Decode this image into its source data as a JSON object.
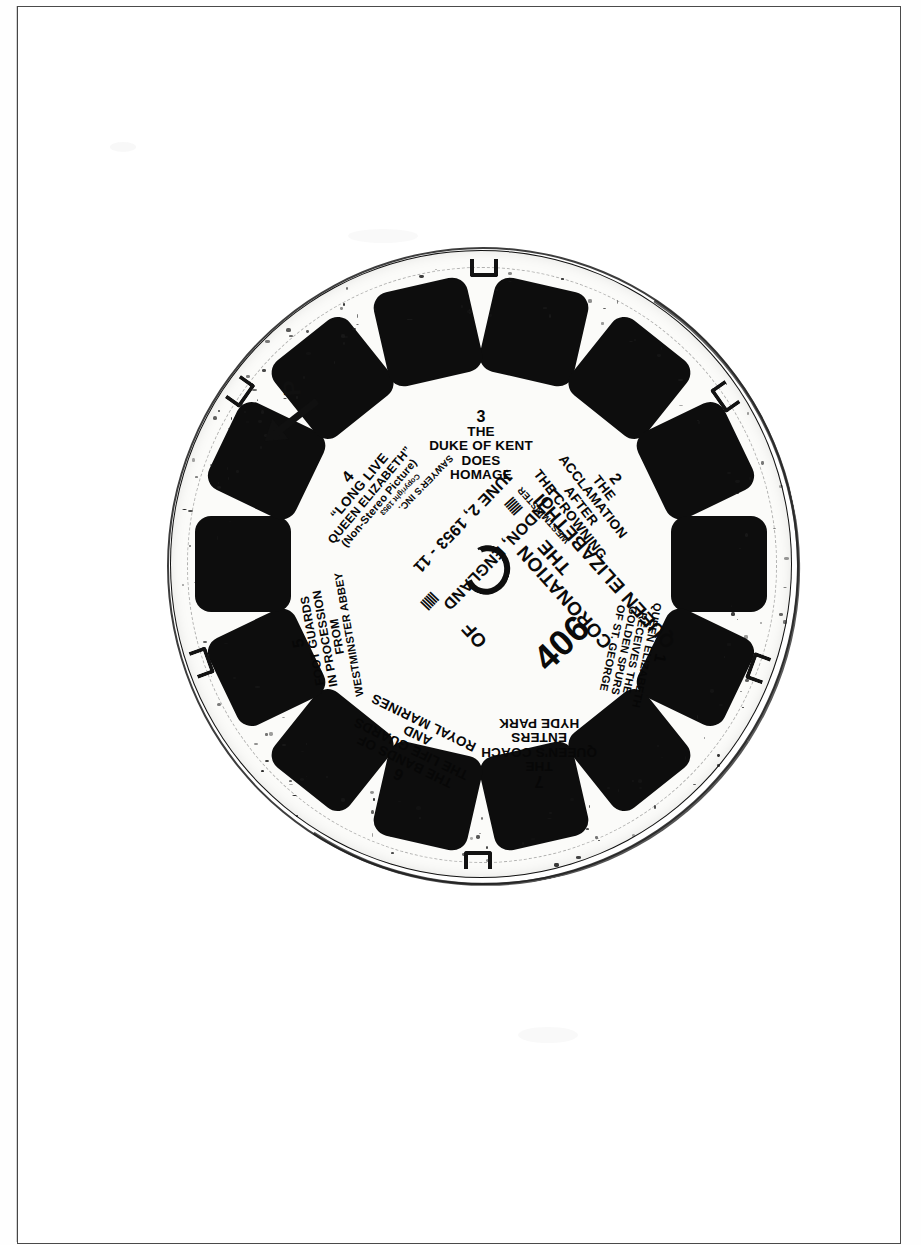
{
  "document": {
    "type": "scanned-photograph",
    "subject": "View-Master reel packet photograph"
  },
  "reel": {
    "catalog_number": "406",
    "title_line_1": "THE",
    "title_line_2": "CORONATION",
    "title_line_3": "OF",
    "title_line_4": "QUEEN ELIZABETH II",
    "title_full": "THE CORONATION OF QUEEN ELIZABETH II",
    "location": "LONDON, ENGLAND",
    "date": "JUNE 2, 1953 - 11",
    "maker": "SAWYER'S INC.",
    "copyright": "Copyright 1953",
    "secondary_mark": "WESTMINSTER",
    "frame_count": 14,
    "direction_letter": "P",
    "colors": {
      "disc": "#fbfbf9",
      "frame": "#0d0d0d",
      "ink": "#090909",
      "border": "#4a4a4a"
    }
  },
  "captions": [
    {
      "number": "1",
      "lines": [
        "QUEEN ELIZABETH",
        "RECEIVES THE",
        "GOLDEN SPURS",
        "OF ST. GEORGE"
      ],
      "sub": ""
    },
    {
      "number": "2",
      "lines": [
        "THE",
        "ACCLAMATION",
        "AFTER",
        "THE CROWNING"
      ],
      "sub": ""
    },
    {
      "number": "3",
      "lines": [
        "THE",
        "DUKE OF KENT",
        "DOES",
        "HOMAGE"
      ],
      "sub": ""
    },
    {
      "number": "4",
      "lines": [
        "“LONG LIVE",
        "QUEEN ELIZABETH”"
      ],
      "sub": "(Non-Stereo Picture)"
    },
    {
      "number": "5",
      "lines": [
        "FOOT GUARDS",
        "IN PROCESSION",
        "FROM",
        "WESTMINSTER ABBEY"
      ],
      "sub": ""
    },
    {
      "number": "6",
      "lines": [
        "THE BANDS OF",
        "THE LIFE GUARDS",
        "AND",
        "ROYAL MARINES"
      ],
      "sub": ""
    },
    {
      "number": "7",
      "lines": [
        "THE",
        "QUEEN'S COACH",
        "ENTERS",
        "HYDE PARK"
      ],
      "sub": ""
    }
  ]
}
